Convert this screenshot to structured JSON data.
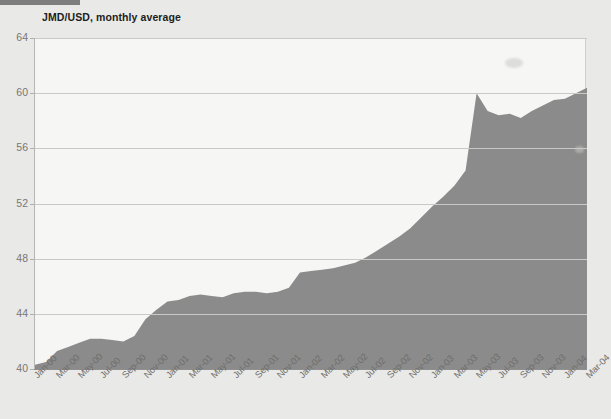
{
  "header": {
    "accent_color": "#7d7d7d",
    "title": "JMD/USD, monthly average"
  },
  "colors": {
    "area_fill": "#8b8b8b",
    "plot_background": "#f6f6f4",
    "page_background": "#e9e9e7",
    "gridline": "#c9c9c9",
    "axis": "#8f8f8f",
    "tick_text": "#777775"
  },
  "chart_data": {
    "type": "area",
    "title": "JMD/USD, monthly average",
    "xlabel": "",
    "ylabel": "",
    "ylim": [
      40,
      64
    ],
    "yticks": [
      40,
      44,
      48,
      52,
      56,
      60,
      64
    ],
    "grid": true,
    "legend": "none",
    "xtick_labels": [
      "Jan-00",
      "Mar-00",
      "May-00",
      "Jul-00",
      "Sep-00",
      "Nov-00",
      "Jan-01",
      "Mar-01",
      "May-01",
      "Jul-01",
      "Sep-01",
      "Nov-01",
      "Jan-02",
      "Mar-02",
      "May-02",
      "Jul-02",
      "Sep-02",
      "Nov-02",
      "Jan-03",
      "Mar-03",
      "May-03",
      "Jul-03",
      "Sep-03",
      "Nov-03",
      "Jan-04",
      "Mar-04"
    ],
    "x": [
      "Jan-00",
      "Feb-00",
      "Mar-00",
      "Apr-00",
      "May-00",
      "Jun-00",
      "Jul-00",
      "Aug-00",
      "Sep-00",
      "Oct-00",
      "Nov-00",
      "Dec-00",
      "Jan-01",
      "Feb-01",
      "Mar-01",
      "Apr-01",
      "May-01",
      "Jun-01",
      "Jul-01",
      "Aug-01",
      "Sep-01",
      "Oct-01",
      "Nov-01",
      "Dec-01",
      "Jan-02",
      "Feb-02",
      "Mar-02",
      "Apr-02",
      "May-02",
      "Jun-02",
      "Jul-02",
      "Aug-02",
      "Sep-02",
      "Oct-02",
      "Nov-02",
      "Dec-02",
      "Jan-03",
      "Feb-03",
      "Mar-03",
      "Apr-03",
      "May-03",
      "Jun-03",
      "Jul-03",
      "Aug-03",
      "Sep-03",
      "Oct-03",
      "Nov-03",
      "Dec-03",
      "Jan-04",
      "Feb-04",
      "Mar-04"
    ],
    "values": [
      40.3,
      40.5,
      41.3,
      41.6,
      41.9,
      42.2,
      42.2,
      42.1,
      42.0,
      42.4,
      43.6,
      44.3,
      44.9,
      45.0,
      45.3,
      45.4,
      45.3,
      45.2,
      45.5,
      45.6,
      45.6,
      45.5,
      45.6,
      45.9,
      47.0,
      47.1,
      47.2,
      47.3,
      47.5,
      47.7,
      48.1,
      48.6,
      49.1,
      49.6,
      50.2,
      51.0,
      51.8,
      52.5,
      53.3,
      54.4,
      60.0,
      58.7,
      58.4,
      58.5,
      58.2,
      58.7,
      59.1,
      59.5,
      59.6,
      60.0,
      60.4
    ],
    "series": [
      {
        "name": "JMD/USD, monthly average",
        "values": [
          40.3,
          40.5,
          41.3,
          41.6,
          41.9,
          42.2,
          42.2,
          42.1,
          42.0,
          42.4,
          43.6,
          44.3,
          44.9,
          45.0,
          45.3,
          45.4,
          45.3,
          45.2,
          45.5,
          45.6,
          45.6,
          45.5,
          45.6,
          45.9,
          47.0,
          47.1,
          47.2,
          47.3,
          47.5,
          47.7,
          48.1,
          48.6,
          49.1,
          49.6,
          50.2,
          51.0,
          51.8,
          52.5,
          53.3,
          54.4,
          60.0,
          58.7,
          58.4,
          58.5,
          58.2,
          58.7,
          59.1,
          59.5,
          59.6,
          60.0,
          60.4
        ]
      }
    ]
  }
}
